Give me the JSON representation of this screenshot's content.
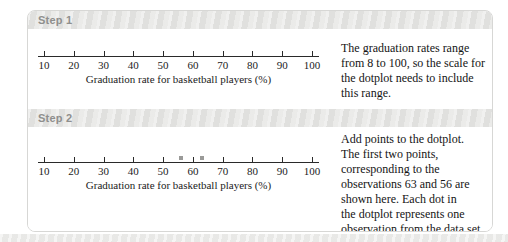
{
  "steps": [
    {
      "header": "Step 1",
      "explanation_lines": [
        "The graduation rates range",
        "from 8 to 100, so the scale for",
        "the dotplot needs to include",
        "this range."
      ]
    },
    {
      "header": "Step 2",
      "explanation_lines": [
        "Add points to the dotplot.",
        "The first two points,",
        "corresponding to the",
        "observations 63 and 56 are",
        "shown here. Each dot in",
        "the dotplot represents one",
        "observation from the data set."
      ]
    }
  ],
  "chart_data": [
    {
      "type": "dotplot",
      "x_ticks": [
        10,
        20,
        30,
        40,
        50,
        60,
        70,
        80,
        90,
        100
      ],
      "values": [],
      "xlabel": "Graduation rate for basketball players (%)",
      "xlim": [
        10,
        100
      ]
    },
    {
      "type": "dotplot",
      "x_ticks": [
        10,
        20,
        30,
        40,
        50,
        60,
        70,
        80,
        90,
        100
      ],
      "values": [
        63,
        56
      ],
      "xlabel": "Graduation rate for basketball players (%)",
      "xlim": [
        10,
        100
      ]
    }
  ]
}
